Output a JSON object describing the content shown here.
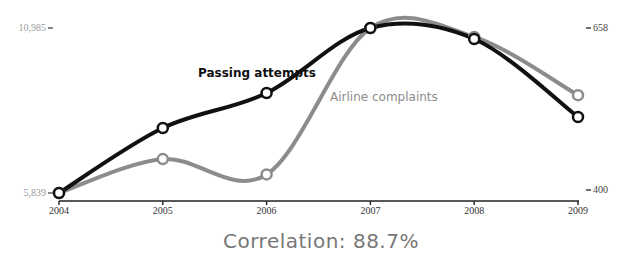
{
  "chart_data": {
    "type": "line",
    "title": "",
    "x": [
      2004,
      2005,
      2006,
      2007,
      2008,
      2009
    ],
    "categories": [
      "2004",
      "2005",
      "2006",
      "2007",
      "2008",
      "2009"
    ],
    "series": [
      {
        "name": "Passing attempts",
        "axis": "left",
        "color": "#111111",
        "values": [
          5839,
          7866,
          8958,
          10985,
          10642,
          8209
        ]
      },
      {
        "name": "Airline complaints",
        "axis": "right",
        "color": "#8c8c8c",
        "values": [
          400,
          453,
          429,
          658,
          644,
          553
        ]
      }
    ],
    "left_axis": {
      "ticks": [
        "10,985",
        "5,839"
      ],
      "ylim": [
        5839,
        10985
      ]
    },
    "right_axis": {
      "ticks": [
        "658",
        "400"
      ],
      "ylim": [
        400,
        658
      ]
    },
    "xlabel": "",
    "ylabel": "",
    "grid": false,
    "legend": "inline labels",
    "annotation": "Correlation: 88.7%"
  },
  "labels": {
    "left_top": "10,985",
    "left_bottom": "5,839",
    "right_top": "658",
    "right_bottom": "400",
    "series_black": "Passing attempts",
    "series_gray": "Airline complaints",
    "correlation": "Correlation: 88.7%"
  }
}
